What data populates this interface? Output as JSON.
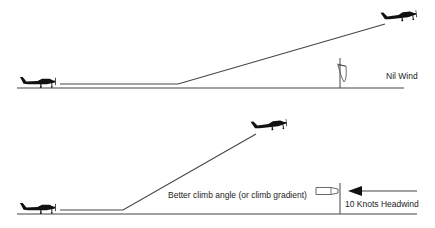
{
  "panels": [
    {
      "name": "nil-wind",
      "wind_label": "Nil Wind"
    },
    {
      "name": "headwind",
      "climb_label": "Better climb angle (or climb gradient)",
      "wind_label": "10 Knots Headwind"
    }
  ],
  "colors": {
    "line": "#333333",
    "aircraft": "#111111"
  }
}
